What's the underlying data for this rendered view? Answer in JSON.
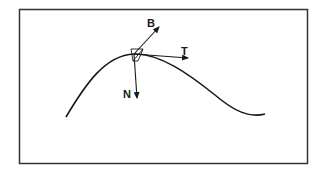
{
  "figure": {
    "colors": {
      "stroke": "#1a1a1a",
      "frame": "#333333",
      "background": "#ffffff"
    },
    "vectors": [
      {
        "id": "B",
        "label": "B",
        "meaning": "binormal"
      },
      {
        "id": "T",
        "label": "T",
        "meaning": "tangent"
      },
      {
        "id": "N",
        "label": "N",
        "meaning": "normal"
      }
    ]
  }
}
